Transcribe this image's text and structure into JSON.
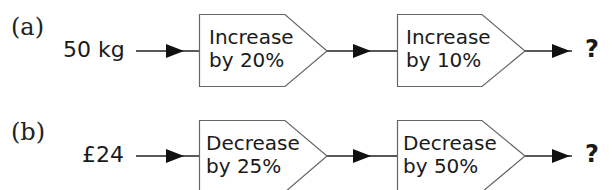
{
  "rows": [
    {
      "label": "(a)",
      "start": "50 kg",
      "steps": [
        {
          "line1": "Increase",
          "line2": "by 20%"
        },
        {
          "line1": "Increase",
          "line2": "by 10%"
        }
      ],
      "result": "?"
    },
    {
      "label": "(b)",
      "start": "£24",
      "steps": [
        {
          "line1": "Decrease",
          "line2": "by 25%"
        },
        {
          "line1": "Decrease",
          "line2": "by 50%"
        }
      ],
      "result": "?"
    }
  ],
  "colors": {
    "stroke": "#555555",
    "arrow": "#111111",
    "text": "#1a1a1a"
  }
}
